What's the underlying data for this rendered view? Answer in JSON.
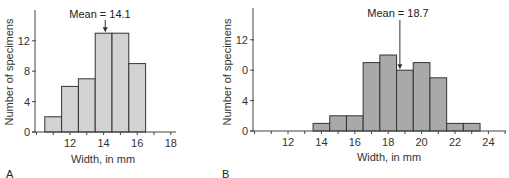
{
  "chart_data": [
    {
      "panel": "A",
      "type": "bar",
      "subtype": "histogram",
      "title": "",
      "xlabel": "Width, in mm",
      "ylabel": "Number of specimens",
      "bin_centers": [
        11,
        12,
        13,
        14,
        15,
        16
      ],
      "values": [
        2,
        6,
        7,
        13,
        13,
        9
      ],
      "x_ticks": [
        "12",
        "14",
        "16",
        "18"
      ],
      "x_tick_values": [
        12,
        14,
        16,
        18
      ],
      "y_ticks": [
        "0",
        "4",
        "8",
        "12"
      ],
      "y_tick_values": [
        0,
        4,
        8,
        12
      ],
      "xlim": [
        10,
        18.2
      ],
      "ylim": [
        0,
        16
      ],
      "annotation": {
        "text": "Mean = 14.1",
        "x": 14.1
      },
      "bar_color": "#d2d2d2",
      "grid": false
    },
    {
      "panel": "B",
      "type": "bar",
      "subtype": "histogram",
      "title": "",
      "xlabel": "Width, in mm",
      "ylabel": "Number of specimens",
      "bin_centers": [
        14,
        15,
        16,
        17,
        18,
        19,
        20,
        21,
        22,
        23
      ],
      "values": [
        1,
        2,
        2,
        9,
        10,
        8,
        9,
        7,
        1,
        1
      ],
      "x_ticks": [
        "12",
        "14",
        "16",
        "18",
        "20",
        "22",
        "24"
      ],
      "x_tick_values": [
        12,
        14,
        16,
        18,
        20,
        22,
        24
      ],
      "y_ticks": [
        "0",
        "4",
        "0",
        "12"
      ],
      "y_tick_values": [
        0,
        4,
        8,
        12
      ],
      "xlim": [
        10,
        25
      ],
      "ylim": [
        0,
        16
      ],
      "annotation": {
        "text": "Mean = 18.7",
        "x": 18.7
      },
      "bar_color": "#a9a9a9",
      "grid": false
    }
  ],
  "panels": {
    "a": {
      "label": "A",
      "xlabel": "Width, in mm",
      "ylabel": "Number of specimens",
      "mean_text": "Mean = 14.1"
    },
    "b": {
      "label": "B",
      "xlabel": "Width, in mm",
      "ylabel": "Number of specimens",
      "mean_text": "Mean = 18.7"
    }
  }
}
